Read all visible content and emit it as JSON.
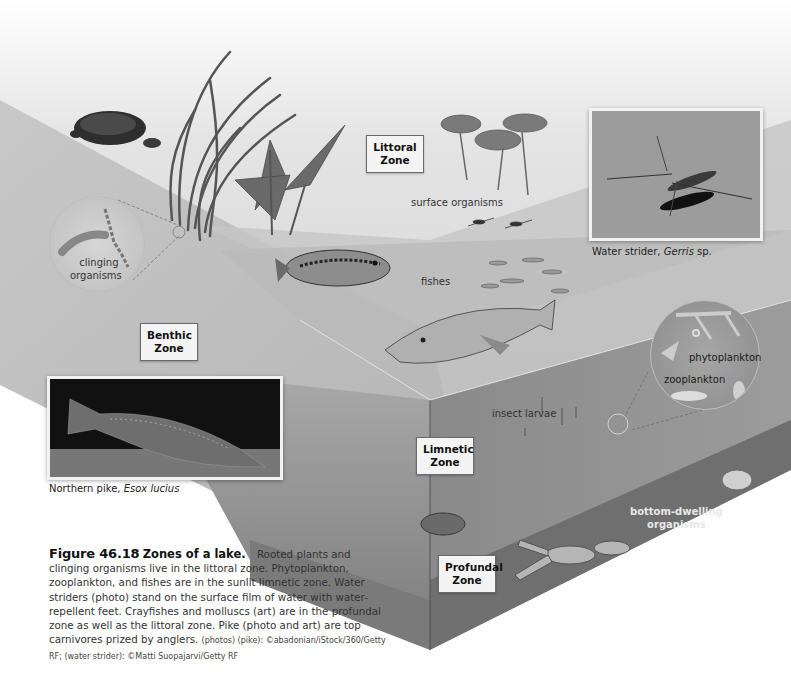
{
  "figure": {
    "number": "Figure 46.18",
    "title": "Zones of a lake.",
    "caption_text": "Rooted plants and clinging organisms live in the littoral zone. Phytoplankton, zooplankton, and fishes are in the sunlit limnetic zone. Water striders (photo) stand on the surface film of water with water-repellent feet. Crayfishes and molluscs (art) are in the profundal zone as well as the littoral zone. Pike (photo and art) are top carnivores prized by anglers.",
    "credit": "(photos) (pike): ©abadonian/iStock/360/Getty RF; (water strider): ©Matti Suopajarvi/Getty RF"
  },
  "zones": [
    {
      "id": "littoral",
      "line1": "Littoral",
      "line2": "Zone"
    },
    {
      "id": "benthic",
      "line1": "Benthic",
      "line2": "Zone"
    },
    {
      "id": "limnetic",
      "line1": "Limnetic",
      "line2": "Zone"
    },
    {
      "id": "profundal",
      "line1": "Profundal",
      "line2": "Zone"
    }
  ],
  "art_labels": {
    "clinging_line1": "clinging",
    "clinging_line2": "organisms",
    "surface": "surface organisms",
    "fishes": "fishes",
    "phytoplankton": "phytoplankton",
    "zooplankton": "zooplankton",
    "insect_larvae": "insect larvae",
    "bottom_line1": "bottom-dwelling",
    "bottom_line2": "organisms"
  },
  "photos": {
    "water_strider": {
      "caption_prefix": "Water strider, ",
      "caption_italic": "Gerris",
      "caption_suffix": " sp."
    },
    "pike": {
      "caption_prefix": "Northern pike, ",
      "caption_italic": "Esox lucius",
      "caption_suffix": ""
    }
  },
  "colors": {
    "water_surface": "#d9d9d9",
    "water_side": "#a9a9a9",
    "water_front": "#8f8f8f",
    "sediment": "#7a7a7a",
    "label_border": "#6a6a6a"
  }
}
